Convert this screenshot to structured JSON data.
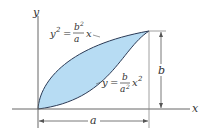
{
  "figure": {
    "axes": {
      "x_label": "x",
      "y_label": "y"
    },
    "curves": [
      {
        "id": "upper",
        "equation_lhs": "y",
        "lhs_exp": "2",
        "eq": "=",
        "num": "b",
        "num_exp": "2",
        "den": "a",
        "tail": "x"
      },
      {
        "id": "lower",
        "equation_lhs": "y",
        "eq": "=",
        "num": "b",
        "den": "a",
        "den_exp": "2",
        "tail": "x",
        "tail_exp": "2"
      }
    ],
    "dimensions": {
      "width_label": "a",
      "height_label": "b"
    },
    "colors": {
      "fill": "#b7dcf3",
      "curve": "#2b3a55",
      "line": "#555555"
    }
  }
}
